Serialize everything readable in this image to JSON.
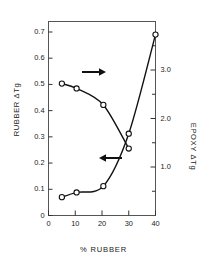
{
  "chart_data": {
    "type": "line",
    "title": "",
    "xlabel": "% RUBBER",
    "ylabel": "RUBBER ΔTg",
    "y2label": "EPOXY ΔTg",
    "xlim": [
      0,
      40
    ],
    "ylim": [
      0,
      0.74
    ],
    "y2lim": [
      0,
      4.0
    ],
    "grid": false,
    "legend": null,
    "x_ticks": [
      "0",
      "10",
      "20",
      "30",
      "40"
    ],
    "x_tick_values": [
      0,
      10,
      20,
      30,
      40
    ],
    "y_ticks": [
      "0",
      "0.1",
      "0.2",
      "0.3",
      "0.4",
      "0.5",
      "0.6",
      "0.7"
    ],
    "y_tick_values": [
      0,
      0.1,
      0.2,
      0.3,
      0.4,
      0.5,
      0.6,
      0.7
    ],
    "y2_ticks": [
      "1.0",
      "2.0",
      "3.0"
    ],
    "y2_tick_values": [
      1.0,
      2.0,
      3.0
    ],
    "y2_minor_tick_values": [
      0.5,
      1.5,
      2.5,
      3.5
    ],
    "series": [
      {
        "name": "RUBBER ΔTg",
        "axis": "left",
        "marker": "open-circle",
        "annotation": "arrow-left",
        "x": [
          5,
          10.5,
          20.5,
          30,
          40
        ],
        "values": [
          0.07,
          0.088,
          0.112,
          0.312,
          0.69
        ]
      },
      {
        "name": "EPOXY ΔTg",
        "axis": "right",
        "marker": "open-circle",
        "annotation": "arrow-right",
        "x": [
          5,
          10.5,
          20.5,
          30
        ],
        "values": [
          2.72,
          2.62,
          2.28,
          1.38
        ]
      }
    ],
    "annotations": [
      {
        "name": "arrow-right",
        "label": "",
        "points_to": "right-axis"
      },
      {
        "name": "arrow-left",
        "label": "",
        "points_to": "left-axis"
      }
    ]
  },
  "colors": {
    "line": "#111111",
    "axis": "#555555",
    "text": "#1a1a1a",
    "marker_fill": "#ffffff",
    "background": "#ffffff"
  }
}
